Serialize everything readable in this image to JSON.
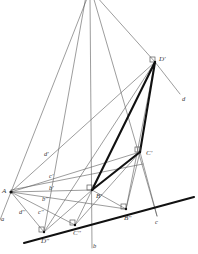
{
  "figure": {
    "background_color": "#ffffff",
    "thin_line_color": "#5a5a5a",
    "thick_line_color": "#111111",
    "ground_line_color": "#111111",
    "label_color": "#3a3a3a",
    "canvas": {
      "width": 198,
      "height": 254
    }
  },
  "points": [
    {
      "id": "A",
      "label": "A",
      "x": 11,
      "y": 192,
      "label_x": 2,
      "label_y": 188,
      "has_right_angle": false
    },
    {
      "id": "Bp",
      "label": "B'",
      "x": 92,
      "y": 190,
      "label_x": 96,
      "label_y": 193,
      "has_right_angle": true
    },
    {
      "id": "Cp",
      "label": "C'",
      "x": 140,
      "y": 152,
      "label_x": 146,
      "label_y": 150,
      "has_right_angle": true
    },
    {
      "id": "Dp",
      "label": "D'",
      "x": 155,
      "y": 62,
      "label_x": 159,
      "label_y": 56,
      "has_right_angle": true
    },
    {
      "id": "Bpp",
      "label": "B''",
      "x": 126,
      "y": 209,
      "label_x": 124,
      "label_y": 215,
      "has_right_angle": true
    },
    {
      "id": "Cpp",
      "label": "C''",
      "x": 75,
      "y": 225,
      "label_x": 73,
      "label_y": 230,
      "has_right_angle": true
    },
    {
      "id": "Dpp",
      "label": "D''",
      "x": 44,
      "y": 232,
      "label_x": 41,
      "label_y": 238,
      "has_right_angle": true
    }
  ],
  "line_labels": [
    {
      "id": "d-right",
      "label": "d",
      "x": 182,
      "y": 96
    },
    {
      "id": "c-right",
      "label": "c",
      "x": 155,
      "y": 219
    },
    {
      "id": "b-bottom",
      "label": "b",
      "x": 93,
      "y": 243
    },
    {
      "id": "d-prime",
      "label": "d'",
      "x": 44,
      "y": 151
    },
    {
      "id": "c-prime",
      "label": "c'",
      "x": 49,
      "y": 173
    },
    {
      "id": "b-prime",
      "label": "b'",
      "x": 49,
      "y": 185
    },
    {
      "id": "b-dprime",
      "label": "b''",
      "x": 42,
      "y": 196
    },
    {
      "id": "c-dprime",
      "label": "c''",
      "x": 38,
      "y": 209
    },
    {
      "id": "d-dprime",
      "label": "d''",
      "x": 19,
      "y": 209
    },
    {
      "id": "a-left",
      "label": "a",
      "x": 1,
      "y": 216
    }
  ],
  "thin_segments": [
    {
      "name": "apex-to-A",
      "x1": 88,
      "y1": -4,
      "x2": 11,
      "y2": 192
    },
    {
      "name": "apex-to-Dpp",
      "x1": 86,
      "y1": -4,
      "x2": 44,
      "y2": 232
    },
    {
      "name": "apex-vertical-b",
      "x1": 90,
      "y1": -4,
      "x2": 92,
      "y2": 248
    },
    {
      "name": "apex-to-Cright",
      "x1": 93,
      "y1": -4,
      "x2": 157,
      "y2": 216
    },
    {
      "name": "apex-to-Dp",
      "x1": 96,
      "y1": -4,
      "x2": 155,
      "y2": 62
    },
    {
      "name": "Dp-to-d-label",
      "x1": 155,
      "y1": 62,
      "x2": 180,
      "y2": 94
    },
    {
      "name": "Dp-to-Bpp",
      "x1": 155,
      "y1": 62,
      "x2": 126,
      "y2": 209
    },
    {
      "name": "A-to-Dp",
      "x1": 11,
      "y1": 192,
      "x2": 155,
      "y2": 62
    },
    {
      "name": "A-to-Cp",
      "x1": 11,
      "y1": 192,
      "x2": 140,
      "y2": 152
    },
    {
      "name": "A-to-Bp",
      "x1": 11,
      "y1": 192,
      "x2": 92,
      "y2": 190
    },
    {
      "name": "A-to-Bpp",
      "x1": 11,
      "y1": 192,
      "x2": 126,
      "y2": 209
    },
    {
      "name": "A-to-Cpp",
      "x1": 11,
      "y1": 192,
      "x2": 75,
      "y2": 225
    },
    {
      "name": "A-to-Dpp",
      "x1": 11,
      "y1": 192,
      "x2": 44,
      "y2": 232
    },
    {
      "name": "A-to-a-left",
      "x1": 11,
      "y1": 192,
      "x2": 0,
      "y2": 220
    },
    {
      "name": "Bp-to-Dpp",
      "x1": 92,
      "y1": 190,
      "x2": 44,
      "y2": 232
    },
    {
      "name": "Bp-to-Cpp",
      "x1": 92,
      "y1": 190,
      "x2": 75,
      "y2": 225
    },
    {
      "name": "Bp-to-Bpp",
      "x1": 92,
      "y1": 190,
      "x2": 126,
      "y2": 209
    },
    {
      "name": "Cp-to-Bpp",
      "x1": 140,
      "y1": 152,
      "x2": 126,
      "y2": 209
    },
    {
      "name": "Cp-to-Cright",
      "x1": 140,
      "y1": 152,
      "x2": 157,
      "y2": 216
    },
    {
      "name": "Cpp-to-Cp",
      "x1": 75,
      "y1": 225,
      "x2": 140,
      "y2": 152
    },
    {
      "name": "Dpp-to-Dp",
      "x1": 44,
      "y1": 232,
      "x2": 155,
      "y2": 62
    },
    {
      "name": "Bp-horizontal",
      "x1": 11,
      "y1": 190,
      "x2": 143,
      "y2": 164
    }
  ],
  "thick_segments": [
    {
      "name": "Bp-to-Dp",
      "x1": 92,
      "y1": 190,
      "x2": 155,
      "y2": 62
    },
    {
      "name": "Bp-to-Cp",
      "x1": 92,
      "y1": 190,
      "x2": 140,
      "y2": 152
    },
    {
      "name": "Cp-to-Dp",
      "x1": 140,
      "y1": 152,
      "x2": 155,
      "y2": 62
    }
  ],
  "ground_line": {
    "name": "ground-line-a",
    "x1": 24,
    "y1": 243,
    "x2": 194,
    "y2": 197
  }
}
